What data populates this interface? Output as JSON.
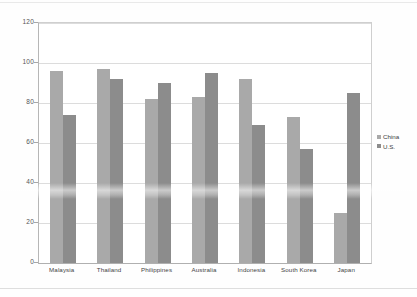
{
  "chart_data": {
    "type": "bar",
    "title": "",
    "subtitle": "",
    "xlabel": "",
    "ylabel": "",
    "categories": [
      "Malaysia",
      "Thailand",
      "Philippines",
      "Australia",
      "Indonesia",
      "South Korea",
      "Japan"
    ],
    "series": [
      {
        "name": "China",
        "color": "#a9a9a9",
        "values": [
          96,
          97,
          82,
          83,
          92,
          73,
          25
        ]
      },
      {
        "name": "U.S.",
        "color": "#8c8c8c",
        "values": [
          74,
          92,
          90,
          95,
          69,
          57,
          85
        ]
      }
    ],
    "ylim": [
      0,
      120
    ],
    "ytick_values": [
      0,
      20,
      40,
      60,
      80,
      100,
      120
    ],
    "ytick_labels": [
      "0",
      "20",
      "40",
      "60",
      "80",
      "100",
      "120"
    ],
    "grid": true,
    "grid_axis": "y",
    "legend_position": "right"
  },
  "legend": {
    "entries": [
      {
        "label": "China",
        "swatch": "legend-swatch-china"
      },
      {
        "label": "U.S.",
        "swatch": "legend-swatch-us"
      }
    ]
  }
}
